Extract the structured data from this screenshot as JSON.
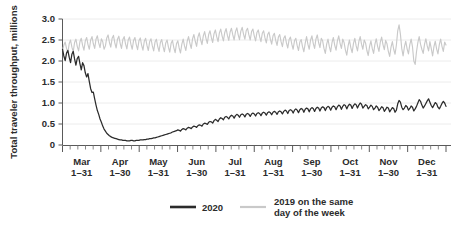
{
  "chart_data": {
    "type": "line",
    "title": "",
    "subtitle": "",
    "xlabel": "",
    "ylabel": "Total traveler throughput, millions",
    "ylim": [
      0,
      3.0
    ],
    "yticks": [
      "0",
      "0.5",
      "1.0",
      "1.5",
      "2.0",
      "2.5",
      "3.0"
    ],
    "ytick_values": [
      0,
      0.5,
      1.0,
      1.5,
      2.0,
      2.5,
      3.0
    ],
    "grid": true,
    "grid_axis": "y",
    "legend_position": "bottom",
    "xtick_labels": [
      {
        "month": "Mar",
        "range": "1–31"
      },
      {
        "month": "Apr",
        "range": "1–30"
      },
      {
        "month": "May",
        "range": "1–31"
      },
      {
        "month": "Jun",
        "range": "1–30"
      },
      {
        "month": "Jul",
        "range": "1–31"
      },
      {
        "month": "Aug",
        "range": "1–31"
      },
      {
        "month": "Sep",
        "range": "1–30"
      },
      {
        "month": "Oct",
        "range": "1–31"
      },
      {
        "month": "Nov",
        "range": "1–30"
      },
      {
        "month": "Dec",
        "range": "1–31"
      }
    ],
    "series": [
      {
        "name": "2020",
        "color": "#2b2b2b",
        "values": [
          2.28,
          2.12,
          2.01,
          2.19,
          2.25,
          2.09,
          1.96,
          2.16,
          2.23,
          2.05,
          1.9,
          2.06,
          2.11,
          1.94,
          1.79,
          1.96,
          1.89,
          1.72,
          1.62,
          1.7,
          1.51,
          1.34,
          1.25,
          1.26,
          1.1,
          0.95,
          0.82,
          0.73,
          0.62,
          0.54,
          0.45,
          0.38,
          0.33,
          0.28,
          0.25,
          0.22,
          0.2,
          0.18,
          0.17,
          0.16,
          0.15,
          0.14,
          0.13,
          0.12,
          0.12,
          0.11,
          0.11,
          0.11,
          0.1,
          0.1,
          0.1,
          0.11,
          0.11,
          0.1,
          0.1,
          0.11,
          0.11,
          0.11,
          0.12,
          0.12,
          0.12,
          0.13,
          0.13,
          0.14,
          0.14,
          0.15,
          0.15,
          0.16,
          0.17,
          0.17,
          0.18,
          0.19,
          0.2,
          0.21,
          0.22,
          0.23,
          0.24,
          0.25,
          0.26,
          0.27,
          0.28,
          0.29,
          0.31,
          0.32,
          0.33,
          0.34,
          0.36,
          0.35,
          0.33,
          0.37,
          0.39,
          0.38,
          0.36,
          0.4,
          0.42,
          0.41,
          0.39,
          0.43,
          0.45,
          0.44,
          0.42,
          0.46,
          0.48,
          0.47,
          0.45,
          0.5,
          0.52,
          0.51,
          0.49,
          0.54,
          0.56,
          0.55,
          0.52,
          0.58,
          0.61,
          0.59,
          0.56,
          0.62,
          0.65,
          0.63,
          0.6,
          0.66,
          0.68,
          0.66,
          0.62,
          0.68,
          0.71,
          0.69,
          0.64,
          0.7,
          0.73,
          0.71,
          0.66,
          0.72,
          0.74,
          0.72,
          0.67,
          0.73,
          0.75,
          0.73,
          0.68,
          0.74,
          0.76,
          0.74,
          0.69,
          0.75,
          0.77,
          0.75,
          0.7,
          0.76,
          0.78,
          0.76,
          0.71,
          0.77,
          0.79,
          0.77,
          0.72,
          0.78,
          0.8,
          0.78,
          0.73,
          0.79,
          0.81,
          0.79,
          0.74,
          0.8,
          0.83,
          0.81,
          0.75,
          0.82,
          0.84,
          0.82,
          0.76,
          0.83,
          0.86,
          0.83,
          0.77,
          0.84,
          0.87,
          0.85,
          0.78,
          0.85,
          0.88,
          0.86,
          0.79,
          0.86,
          0.89,
          0.87,
          0.8,
          0.87,
          0.9,
          0.88,
          0.81,
          0.88,
          0.91,
          0.89,
          0.82,
          0.89,
          0.92,
          0.9,
          0.83,
          0.9,
          0.93,
          0.91,
          0.84,
          0.91,
          0.95,
          0.93,
          0.85,
          0.92,
          0.96,
          0.94,
          0.86,
          0.93,
          0.97,
          0.95,
          0.87,
          0.94,
          0.98,
          0.96,
          0.88,
          0.95,
          1.0,
          0.97,
          0.88,
          0.92,
          0.96,
          0.94,
          0.86,
          0.9,
          0.95,
          0.92,
          0.84,
          0.88,
          0.93,
          0.9,
          0.82,
          0.86,
          0.91,
          0.89,
          0.8,
          0.85,
          0.9,
          0.88,
          0.79,
          0.84,
          0.89,
          0.87,
          0.78,
          0.83,
          0.98,
          1.06,
          1.02,
          0.9,
          0.84,
          0.88,
          0.94,
          0.91,
          0.83,
          0.87,
          0.93,
          0.9,
          0.81,
          0.86,
          0.92,
          1.0,
          1.08,
          1.04,
          0.95,
          0.88,
          0.93,
          0.99,
          1.05,
          1.1,
          1.02,
          0.94,
          0.89,
          0.95,
          1.01,
          0.98,
          0.9,
          0.86,
          0.92,
          0.99,
          1.04,
          1.0,
          0.92
        ]
      },
      {
        "name": "2019 on the same day of the week",
        "color": "#c9c9c9",
        "values": [
          2.26,
          2.38,
          2.45,
          2.3,
          2.2,
          2.41,
          2.5,
          2.33,
          2.22,
          2.44,
          2.52,
          2.35,
          2.24,
          2.46,
          2.54,
          2.37,
          2.26,
          2.48,
          2.56,
          2.39,
          2.28,
          2.5,
          2.58,
          2.41,
          2.3,
          2.52,
          2.6,
          2.43,
          2.32,
          2.53,
          2.46,
          2.28,
          2.36,
          2.55,
          2.62,
          2.44,
          2.33,
          2.54,
          2.61,
          2.43,
          2.31,
          2.52,
          2.59,
          2.42,
          2.3,
          2.51,
          2.58,
          2.41,
          2.29,
          2.5,
          2.57,
          2.4,
          2.28,
          2.49,
          2.56,
          2.39,
          2.27,
          2.48,
          2.55,
          2.38,
          2.26,
          2.47,
          2.54,
          2.37,
          2.25,
          2.46,
          2.53,
          2.36,
          2.24,
          2.45,
          2.52,
          2.35,
          2.23,
          2.44,
          2.51,
          2.34,
          2.22,
          2.43,
          2.5,
          2.33,
          2.21,
          2.42,
          2.49,
          2.32,
          2.2,
          2.41,
          2.48,
          2.31,
          2.19,
          2.4,
          2.52,
          2.36,
          2.25,
          2.47,
          2.58,
          2.42,
          2.3,
          2.53,
          2.63,
          2.47,
          2.35,
          2.57,
          2.67,
          2.51,
          2.39,
          2.6,
          2.7,
          2.54,
          2.42,
          2.63,
          2.72,
          2.56,
          2.44,
          2.65,
          2.74,
          2.58,
          2.46,
          2.67,
          2.76,
          2.6,
          2.48,
          2.68,
          2.77,
          2.61,
          2.49,
          2.69,
          2.78,
          2.62,
          2.5,
          2.7,
          2.79,
          2.63,
          2.51,
          2.71,
          2.8,
          2.64,
          2.52,
          2.72,
          2.78,
          2.62,
          2.5,
          2.7,
          2.76,
          2.6,
          2.48,
          2.68,
          2.74,
          2.58,
          2.46,
          2.66,
          2.72,
          2.55,
          2.43,
          2.63,
          2.69,
          2.52,
          2.4,
          2.6,
          2.66,
          2.49,
          2.37,
          2.57,
          2.63,
          2.46,
          2.34,
          2.54,
          2.6,
          2.43,
          2.31,
          2.51,
          2.57,
          2.4,
          2.28,
          2.48,
          2.54,
          2.37,
          2.25,
          2.45,
          2.51,
          2.34,
          2.22,
          2.42,
          2.58,
          2.4,
          2.28,
          2.5,
          2.6,
          2.42,
          2.3,
          2.52,
          2.62,
          2.44,
          2.32,
          2.54,
          2.48,
          2.3,
          2.18,
          2.4,
          2.52,
          2.34,
          2.22,
          2.44,
          2.56,
          2.38,
          2.26,
          2.48,
          2.6,
          2.42,
          2.3,
          2.52,
          2.44,
          2.26,
          2.14,
          2.36,
          2.5,
          2.32,
          2.2,
          2.42,
          2.54,
          2.36,
          2.24,
          2.46,
          2.58,
          2.4,
          2.28,
          2.5,
          2.43,
          2.25,
          2.13,
          2.35,
          2.48,
          2.3,
          2.18,
          2.4,
          2.53,
          2.35,
          2.23,
          2.45,
          2.57,
          2.39,
          2.27,
          2.49,
          2.41,
          2.23,
          2.11,
          2.33,
          2.46,
          2.28,
          2.16,
          2.38,
          2.72,
          2.86,
          2.64,
          2.3,
          2.12,
          2.34,
          2.47,
          2.29,
          2.17,
          2.39,
          2.52,
          2.34,
          2.0,
          1.92,
          2.22,
          2.44,
          2.58,
          2.4,
          2.28,
          2.18,
          2.4,
          2.53,
          2.36,
          2.24,
          2.46,
          2.3,
          2.12,
          2.34,
          2.47,
          2.29,
          2.17,
          2.39,
          2.52,
          2.35,
          2.23,
          2.45,
          2.38
        ]
      }
    ]
  },
  "legend": {
    "items": [
      {
        "label": "2020",
        "color": "#2b2b2b",
        "thickness": 2.6
      },
      {
        "label_line1": "2019 on the same",
        "label_line2": "day of the week",
        "color": "#c9c9c9",
        "thickness": 2.2
      }
    ]
  }
}
